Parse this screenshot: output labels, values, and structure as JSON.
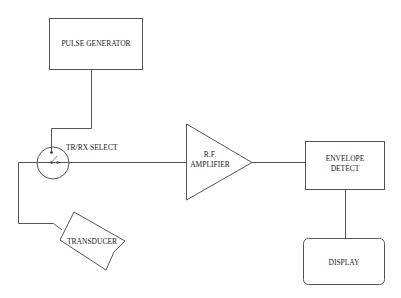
{
  "diagram": {
    "type": "block-diagram",
    "blocks": {
      "pulse_generator": {
        "label": "PULSE GENERATOR",
        "shape": "rectangle"
      },
      "trx_select": {
        "label": "TR/RX SELECT",
        "shape": "circle-switch"
      },
      "transducer": {
        "label": "TRANSDUCER",
        "shape": "polygon"
      },
      "rf_amplifier": {
        "label_line1": "R.F.",
        "label_line2": "AMPLIFIER",
        "shape": "triangle"
      },
      "envelope_detect": {
        "label_line1": "ENVELOPE",
        "label_line2": "DETECT",
        "shape": "rectangle"
      },
      "display": {
        "label": "DISPLAY",
        "shape": "rounded-rectangle"
      }
    },
    "connections": [
      {
        "from": "PULSE GENERATOR",
        "to": "TR/RX SELECT"
      },
      {
        "from": "TR/RX SELECT",
        "to": "TRANSDUCER"
      },
      {
        "from": "TR/RX SELECT",
        "to": "R.F. AMPLIFIER"
      },
      {
        "from": "R.F. AMPLIFIER",
        "to": "ENVELOPE DETECT"
      },
      {
        "from": "ENVELOPE DETECT",
        "to": "DISPLAY"
      }
    ],
    "colors": {
      "line": "#555555",
      "text": "#222222",
      "background": "#ffffff"
    }
  }
}
